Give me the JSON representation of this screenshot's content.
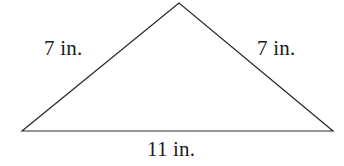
{
  "figure": {
    "kind": "geometry-diagram",
    "shape_name": "isosceles-triangle",
    "background_color": "#ffffff",
    "stroke_color": "#2b2b2b",
    "stroke_width": 1.2,
    "text_color": "#1a1a1a",
    "canvas": {
      "width": 344,
      "height": 166
    },
    "vertices": {
      "apex": {
        "x": 179,
        "y": 3
      },
      "bottom_left": {
        "x": 22,
        "y": 131
      },
      "bottom_right": {
        "x": 333,
        "y": 131
      }
    },
    "points_attr": "179,3 22,131 333,131"
  },
  "labels": {
    "left_side": "7 in.",
    "right_side": "7 in.",
    "base": "11 in."
  },
  "chart_data": {
    "type": "diagram",
    "title": "",
    "shape": "isosceles triangle",
    "measurements": [
      {
        "side": "left",
        "value": 7,
        "unit": "in.",
        "label": "7 in."
      },
      {
        "side": "right",
        "value": 7,
        "unit": "in.",
        "label": "7 in."
      },
      {
        "side": "base",
        "value": 11,
        "unit": "in.",
        "label": "11 in."
      }
    ]
  }
}
